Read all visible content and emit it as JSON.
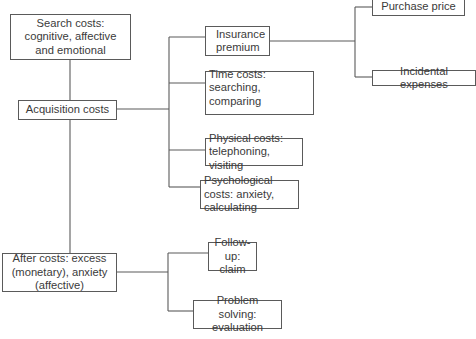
{
  "diagram": {
    "type": "cost-breakdown-tree",
    "nodes": {
      "search_costs": "Search costs: cognitive, affective and emotional",
      "acquisition_costs": "Acquisition costs",
      "after_costs": "After costs: excess (monetary), anxiety (affective)",
      "insurance_premium": "Insurance premium",
      "time_costs": "Time costs: searching, comparing",
      "physical_costs": "Physical costs: telephoning, visiting",
      "psychological_costs": "Psychological costs: anxiety, calculating",
      "purchase_price": "Purchase price",
      "incidental_expenses": "Incidental expenses",
      "follow_up": "Follow-up: claim",
      "problem_solving": "Problem solving: evaluation"
    },
    "edges": [
      [
        "search_costs",
        "acquisition_costs"
      ],
      [
        "acquisition_costs",
        "after_costs"
      ],
      [
        "acquisition_costs",
        "insurance_premium"
      ],
      [
        "acquisition_costs",
        "time_costs"
      ],
      [
        "acquisition_costs",
        "physical_costs"
      ],
      [
        "acquisition_costs",
        "psychological_costs"
      ],
      [
        "insurance_premium",
        "purchase_price"
      ],
      [
        "insurance_premium",
        "incidental_expenses"
      ],
      [
        "after_costs",
        "follow_up"
      ],
      [
        "after_costs",
        "problem_solving"
      ]
    ],
    "line_color": "#5a5a5a"
  }
}
